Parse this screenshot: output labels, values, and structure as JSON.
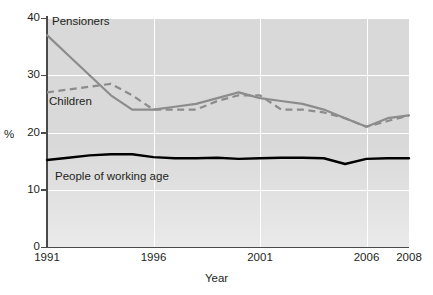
{
  "chart_data": {
    "type": "line",
    "title": "",
    "xlabel": "Year",
    "ylabel": "%",
    "xlim": [
      1991,
      2008
    ],
    "ylim": [
      0,
      40
    ],
    "xticks": [
      "1991",
      "1996",
      "2001",
      "2006",
      "2008"
    ],
    "xtick_values": [
      1991,
      1996,
      2001,
      2006,
      2008
    ],
    "yticks": [
      "0",
      "10",
      "20",
      "30",
      "40"
    ],
    "ytick_values": [
      0,
      10,
      20,
      30,
      40
    ],
    "grid": "white gridlines, horizontal at 10/20/30/40 and vertical at 1996/2001/2006",
    "legend": "inline annotations on plot",
    "x": [
      1991,
      1992,
      1993,
      1994,
      1995,
      1996,
      1997,
      1998,
      1999,
      2000,
      2001,
      2002,
      2003,
      2004,
      2005,
      2006,
      2007,
      2008
    ],
    "series": [
      {
        "name": "Pensioners",
        "style": "solid",
        "color": "#8c8c8c",
        "values": [
          37,
          33.5,
          30,
          26.5,
          24,
          24,
          24.5,
          25,
          26,
          27,
          26,
          25.5,
          25,
          24,
          22.5,
          21,
          22.5,
          23
        ]
      },
      {
        "name": "Children",
        "style": "dashed",
        "color": "#8c8c8c",
        "values": [
          27,
          27.5,
          28,
          28.5,
          26.5,
          24,
          24,
          24,
          25.5,
          26.5,
          26.5,
          24,
          24,
          23.5,
          22.5,
          21,
          22,
          23
        ]
      },
      {
        "name": "People of working age",
        "style": "solid",
        "color": "#000000",
        "values": [
          15.2,
          15.6,
          16,
          16.2,
          16.2,
          15.7,
          15.5,
          15.5,
          15.6,
          15.4,
          15.5,
          15.6,
          15.6,
          15.5,
          14.5,
          15.4,
          15.5,
          15.5
        ]
      }
    ],
    "annotations": [
      {
        "text": "Pensioners",
        "x": 1991.6,
        "y": 39.2
      },
      {
        "text": "Children",
        "x": 1991.3,
        "y": 25.6
      },
      {
        "text": "People of working age",
        "x": 1991.7,
        "y": 12.6
      }
    ]
  }
}
